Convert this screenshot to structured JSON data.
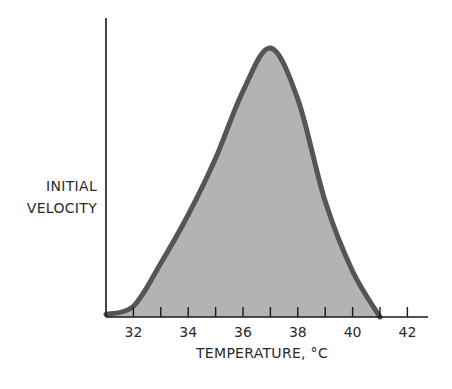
{
  "chart_data": {
    "type": "area",
    "title": "",
    "xlabel": "TEMPERATURE, °C",
    "ylabel": "INITIAL VELOCITY",
    "ylabel_lines": [
      "INITIAL",
      "VELOCITY"
    ],
    "xlim": [
      31,
      43
    ],
    "ylim": [
      0,
      100
    ],
    "x_ticks": [
      32,
      33,
      34,
      35,
      36,
      37,
      38,
      39,
      40,
      41,
      42
    ],
    "x_tick_labels": [
      "32",
      "34",
      "36",
      "38",
      "40",
      "42"
    ],
    "grid": false,
    "legend": null,
    "series": [
      {
        "name": "Initial velocity",
        "x": [
          31,
          32,
          33,
          34,
          35,
          36,
          37,
          38,
          39,
          40,
          41
        ],
        "values": [
          1,
          4,
          20,
          38,
          59,
          84,
          100,
          81,
          43,
          17,
          0
        ]
      }
    ],
    "annotations": [
      "Temperature optimum near 37 °C"
    ],
    "colors": {
      "fill": "#b3b3b3",
      "line": "#555555",
      "axis": "#1a1a1a"
    }
  }
}
